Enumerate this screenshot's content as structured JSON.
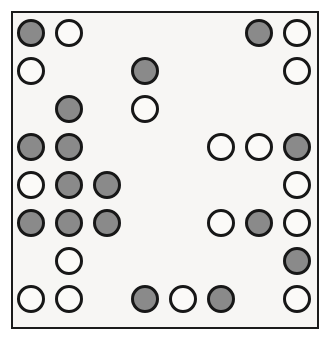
{
  "figure": {
    "background_color": "#f7f6f4",
    "page_color": "#ffffff",
    "border_color": "#1b1b1b",
    "filled_color": "#8a8a8a",
    "open_color": "#fbfaf8",
    "outline_color": "#171717",
    "rows": 8,
    "columns": 8,
    "circle_diameter": 28,
    "column_spacing": 38,
    "row_spacing": 38,
    "first_center_x": 31,
    "first_center_y": 33
  },
  "legend": {
    "filled_label": "filled circle",
    "open_label": "open circle",
    "empty_label": "empty cell"
  },
  "chart_data": {
    "type": "heatmap",
    "xlabel": "",
    "ylabel": "",
    "categories": [
      "1",
      "2",
      "3",
      "4",
      "5",
      "6",
      "7",
      "8"
    ],
    "row_labels": [
      "1",
      "2",
      "3",
      "4",
      "5",
      "6",
      "7",
      "8"
    ],
    "states": [
      "empty",
      "open",
      "filled"
    ],
    "counts": {
      "filled": 19,
      "open": 18,
      "empty": 27
    },
    "cells": [
      [
        "filled",
        "open",
        "empty",
        "empty",
        "empty",
        "empty",
        "filled",
        "open"
      ],
      [
        "open",
        "empty",
        "empty",
        "filled",
        "empty",
        "empty",
        "empty",
        "open"
      ],
      [
        "empty",
        "filled",
        "empty",
        "open",
        "empty",
        "empty",
        "empty",
        "empty"
      ],
      [
        "filled",
        "filled",
        "empty",
        "empty",
        "empty",
        "open",
        "open",
        "filled"
      ],
      [
        "open",
        "filled",
        "filled",
        "empty",
        "empty",
        "empty",
        "empty",
        "open"
      ],
      [
        "filled",
        "filled",
        "filled",
        "empty",
        "empty",
        "open",
        "filled",
        "open"
      ],
      [
        "empty",
        "open",
        "empty",
        "empty",
        "empty",
        "empty",
        "empty",
        "filled"
      ],
      [
        "open",
        "open",
        "empty",
        "filled",
        "open",
        "filled",
        "empty",
        "open"
      ]
    ]
  }
}
